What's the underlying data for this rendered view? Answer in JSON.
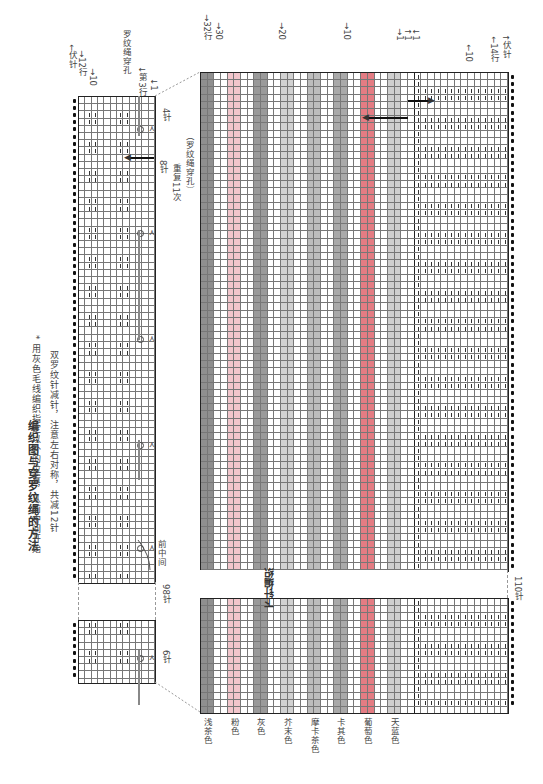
{
  "title": "编织图与穿罗纹绳的方法",
  "notes": [
    "* 用灰色毛线编织指定以外的位置，从前中间开始",
    "双罗纹针减针，注意左右对称，共减12针"
  ],
  "left_chart": {
    "row_labels": {
      "bind_off": "伏针",
      "rows12": "12行",
      "row10": "10",
      "row3": "第3行",
      "row1": "1"
    },
    "cable_hole_label": "罗纹绳穿孔",
    "stitch_labels": {
      "four": "4针",
      "eight": "8针",
      "repeat": "重复11次",
      "repeat_note": "（罗纹绳穿孔）",
      "ninety_eight": "98针",
      "six": "6针"
    },
    "front_center": "前中间",
    "rows": 12
  },
  "right_chart": {
    "row_labels_color": {
      "r32": "32行",
      "r30": "30",
      "r20": "20",
      "r10": "10",
      "r1": "1"
    },
    "row_labels_rib": {
      "r1a": "1",
      "r1b": "1",
      "r10": "10",
      "r14": "14行",
      "bind_off": "伏针"
    },
    "center_label": "下针编织",
    "stitch_count": "110针",
    "color_rows": 32,
    "rib_rows": 14,
    "stripes": [
      {
        "name": "浅茶色",
        "color": "#8f8f8f"
      },
      {
        "name": "粉色",
        "color": "#f2c6cc"
      },
      {
        "name": "灰色",
        "color": "#9a9a9a"
      },
      {
        "name": "芥末色",
        "color": "#d2d2d2"
      },
      {
        "name": "摩卡茶色",
        "color": "#bdbdbd"
      },
      {
        "name": "卡其色",
        "color": "#a9a9a9"
      },
      {
        "name": "葡萄色",
        "color": "#e47c83"
      },
      {
        "name": "天蓝色",
        "color": "#cfcfcf"
      }
    ]
  }
}
